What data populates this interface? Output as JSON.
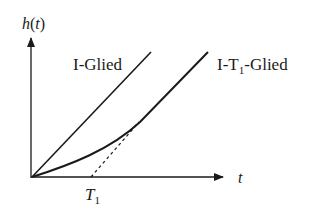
{
  "diagram": {
    "type": "step-response-comparison",
    "y_axis": {
      "label_func": "h",
      "label_arg": "t"
    },
    "x_axis": {
      "label": "t"
    },
    "x_marker": {
      "label_main": "T",
      "label_sub": "1"
    },
    "curves": [
      {
        "name": "I-Glied",
        "label": "I-Glied",
        "style": "solid straight line from origin"
      },
      {
        "name": "I-T1-Glied",
        "label_prefix": "I-T",
        "label_sub": "1",
        "label_suffix": "-Glied",
        "style": "solid curve, asymptotic to line through T1"
      },
      {
        "name": "asymptote",
        "style": "dashed line starting at T1"
      }
    ],
    "colors": {
      "line": "#1a1a1a",
      "background": "#ffffff"
    }
  }
}
